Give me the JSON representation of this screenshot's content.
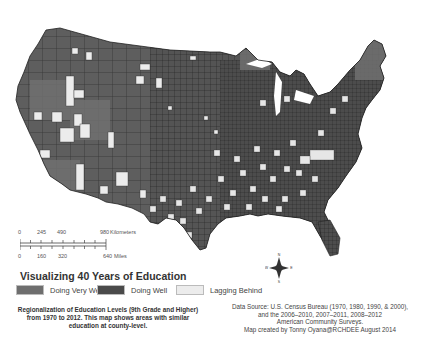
{
  "map": {
    "title": "Visualizing 40 Years of Education",
    "region": "Contiguous United States (county-level)",
    "colors": {
      "doing_very_well": "#6e6e6e",
      "doing_well": "#4a4a4a",
      "lagging_behind": "#ececec",
      "county_border": "#222222",
      "background": "#ffffff"
    }
  },
  "legend": {
    "items": [
      {
        "label": "Doing Very Well",
        "color": "#6e6e6e"
      },
      {
        "label": "Doing Well",
        "color": "#4a4a4a"
      },
      {
        "label": "Lagging Behind",
        "color": "#ececec"
      }
    ]
  },
  "scale_bar": {
    "kilometers": {
      "ticks": [
        "0",
        "245",
        "490",
        "980"
      ],
      "unit": "Kilometers"
    },
    "miles": {
      "ticks": [
        "0",
        "160",
        "320",
        "640"
      ],
      "unit": "Miles"
    }
  },
  "compass": {
    "n": "N",
    "s": "S",
    "e": "E",
    "w": "W"
  },
  "description": "Regionalization of Education Levels (9th Grade and Higher) from 1970 to 2012. This map shows areas with similar education at county-level.",
  "source": {
    "line1": "Data Source: U.S. Census Bureau (1970, 1980, 1990, & 2000),",
    "line2": "and the 2006–2010,  2007–2011, 2008–2012",
    "line3": "American Community Surveys.",
    "line4": "Map created by Tonny Oyana@RCHDEE August 2014"
  }
}
